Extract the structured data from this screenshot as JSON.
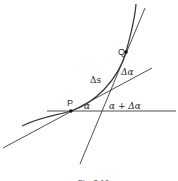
{
  "figure": {
    "points": [
      {
        "label": "P",
        "x": 71,
        "y": 111
      },
      {
        "label": "Q",
        "x": 126,
        "y": 52
      }
    ],
    "labels": {
      "P": "P",
      "Q": "Q",
      "arc": "Δs",
      "delta_angle": "Δα",
      "alpha": "α",
      "alpha_plus_delta": "α + Δα"
    },
    "caption": "Fig. 2.10",
    "colors": {
      "stroke": "#3a3a3a",
      "point": "#111111"
    }
  }
}
